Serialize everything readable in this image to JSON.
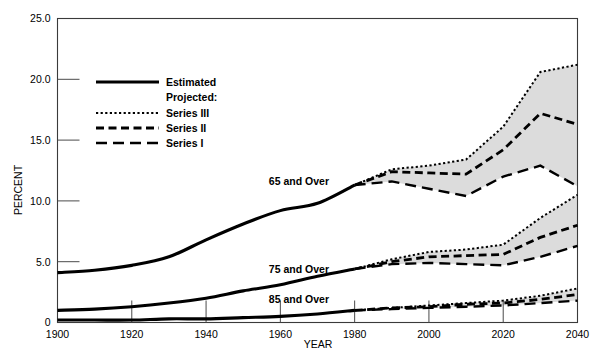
{
  "chart_data": {
    "type": "line",
    "title": "",
    "xlabel": "YEAR",
    "ylabel": "PERCENT",
    "xlim": [
      1900,
      2040
    ],
    "ylim": [
      0,
      25
    ],
    "xticks": [
      "1900",
      "1920",
      "1940",
      "1960",
      "1980",
      "2000",
      "2020",
      "2040"
    ],
    "yticks": [
      "0",
      "5.0",
      "10.0",
      "15.0",
      "20.0",
      "25.0"
    ],
    "grid": false,
    "legend_position": "upper-left-inside",
    "legend": {
      "estimated_label": "Estimated",
      "projected_header": "Projected:",
      "series3_label": "Series III",
      "series2_label": "Series II",
      "series1_label": "Series I"
    },
    "annotations": [
      {
        "text": "65 and Over",
        "x": 1965,
        "y": 11.3
      },
      {
        "text": "75 and Over",
        "x": 1965,
        "y": 4.1
      },
      {
        "text": "85 and Over",
        "x": 1965,
        "y": 1.6
      }
    ],
    "groups": [
      {
        "name": "65 and Over",
        "estimated": {
          "x": [
            1900,
            1910,
            1920,
            1930,
            1940,
            1950,
            1960,
            1970,
            1980
          ],
          "y": [
            4.1,
            4.3,
            4.7,
            5.4,
            6.8,
            8.1,
            9.2,
            9.8,
            11.3
          ]
        },
        "series3": {
          "x": [
            1980,
            1990,
            2000,
            2010,
            2020,
            2030,
            2040
          ],
          "y": [
            11.3,
            12.6,
            12.9,
            13.4,
            16.1,
            20.6,
            21.2
          ]
        },
        "series2": {
          "x": [
            1980,
            1990,
            2000,
            2010,
            2020,
            2030,
            2040
          ],
          "y": [
            11.3,
            12.4,
            12.3,
            12.2,
            14.2,
            17.2,
            16.3
          ]
        },
        "series1": {
          "x": [
            1980,
            1990,
            2000,
            2010,
            2020,
            2030,
            2040
          ],
          "y": [
            11.3,
            11.6,
            11.0,
            10.4,
            12.0,
            12.9,
            11.2
          ]
        }
      },
      {
        "name": "75 and Over",
        "estimated": {
          "x": [
            1900,
            1910,
            1920,
            1930,
            1940,
            1950,
            1960,
            1970,
            1980
          ],
          "y": [
            1.0,
            1.1,
            1.3,
            1.6,
            2.0,
            2.6,
            3.1,
            3.8,
            4.4
          ]
        },
        "series3": {
          "x": [
            1980,
            1990,
            2000,
            2010,
            2020,
            2030,
            2040
          ],
          "y": [
            4.4,
            5.2,
            5.8,
            6.0,
            6.4,
            8.6,
            10.5
          ]
        },
        "series2": {
          "x": [
            1980,
            1990,
            2000,
            2010,
            2020,
            2030,
            2040
          ],
          "y": [
            4.4,
            5.0,
            5.4,
            5.5,
            5.6,
            7.0,
            8.0
          ]
        },
        "series1": {
          "x": [
            1980,
            1990,
            2000,
            2010,
            2020,
            2030,
            2040
          ],
          "y": [
            4.4,
            4.8,
            4.9,
            4.8,
            4.7,
            5.4,
            6.3
          ]
        }
      },
      {
        "name": "85 and Over",
        "estimated": {
          "x": [
            1900,
            1910,
            1920,
            1930,
            1940,
            1950,
            1960,
            1970,
            1980
          ],
          "y": [
            0.2,
            0.2,
            0.2,
            0.3,
            0.3,
            0.4,
            0.5,
            0.7,
            1.0
          ]
        },
        "series3": {
          "x": [
            1980,
            1990,
            2000,
            2010,
            2020,
            2030,
            2040
          ],
          "y": [
            1.0,
            1.2,
            1.4,
            1.6,
            1.8,
            2.2,
            2.8
          ]
        },
        "series2": {
          "x": [
            1980,
            1990,
            2000,
            2010,
            2020,
            2030,
            2040
          ],
          "y": [
            1.0,
            1.2,
            1.3,
            1.5,
            1.6,
            1.9,
            2.3
          ]
        },
        "series1": {
          "x": [
            1980,
            1990,
            2000,
            2010,
            2020,
            2030,
            2040
          ],
          "y": [
            1.0,
            1.1,
            1.2,
            1.3,
            1.4,
            1.6,
            1.8
          ]
        }
      }
    ]
  }
}
